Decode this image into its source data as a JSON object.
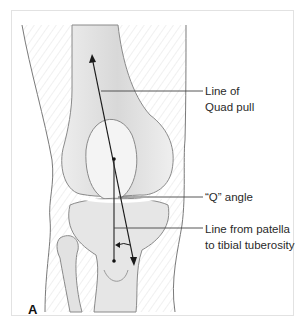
{
  "figure": {
    "panel_letter": "A",
    "labels": {
      "quad_pull_line1": "Line of",
      "quad_pull_line2": "Quad pull",
      "q_angle": "“Q” angle",
      "patella_line1": "Line from patella",
      "patella_line2": "to tibial tuberosity"
    },
    "colors": {
      "line": "#1a1a1a",
      "leader": "#444444",
      "bone_fill": "#e9e9e9",
      "bone_outline": "#8a8a8a",
      "skin_outline": "#7a7a7a",
      "frame": "#e2e2e2"
    }
  }
}
